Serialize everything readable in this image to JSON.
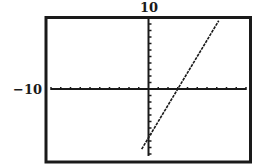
{
  "labels": {
    "ymax": "10",
    "xmin": "−10"
  },
  "colors": {
    "ink": "#1a1a1a",
    "background": "#ffffff"
  },
  "chart_data": {
    "type": "line",
    "title": "",
    "xlabel": "",
    "ylabel": "",
    "xlim": [
      -10,
      10
    ],
    "ylim": [
      -10.3,
      10.8
    ],
    "xscl": 1,
    "yscl": 1,
    "grid": false,
    "axes_visible": true,
    "visible_labels": {
      "top": "10",
      "left": "−10"
    },
    "series": [
      {
        "name": "y = 2.5x − 7.5",
        "slope": 2.5,
        "intercept": -7.5,
        "x": [
          -0.7,
          3,
          7.2
        ],
        "y": [
          -9.25,
          0,
          10.5
        ]
      }
    ],
    "annotations": {
      "x_intercept": 3,
      "y_intercept": -7.5
    }
  }
}
